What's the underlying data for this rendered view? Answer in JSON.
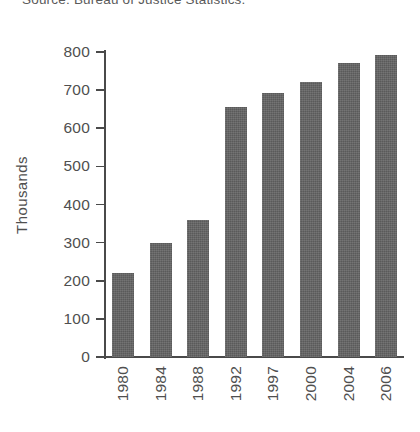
{
  "source_note": "Source: Bureau of Justice Statistics.",
  "chart_data": {
    "type": "bar",
    "title": "",
    "subtitle": "",
    "xlabel": "",
    "ylabel": "Thousands",
    "categories": [
      "1980",
      "1984",
      "1988",
      "1992",
      "1997",
      "2000",
      "2004",
      "2006"
    ],
    "values": [
      220,
      300,
      360,
      657,
      693,
      722,
      772,
      793
    ],
    "ylim": [
      0,
      800
    ],
    "y_ticks": [
      0,
      100,
      200,
      300,
      400,
      500,
      600,
      700,
      800
    ],
    "y_tick_labels": [
      "0",
      "100",
      "200",
      "300",
      "400",
      "500",
      "600",
      "700",
      "800"
    ],
    "grid": false,
    "legend": null,
    "legend_position": "none",
    "bar_color": "#636363",
    "axis_color": "#4a4a4a",
    "background_color": "#ffffff",
    "x_tick_label_rotation": 90,
    "y_axis_label_rotation": 90,
    "data_labels_shown": false,
    "annotations": []
  }
}
